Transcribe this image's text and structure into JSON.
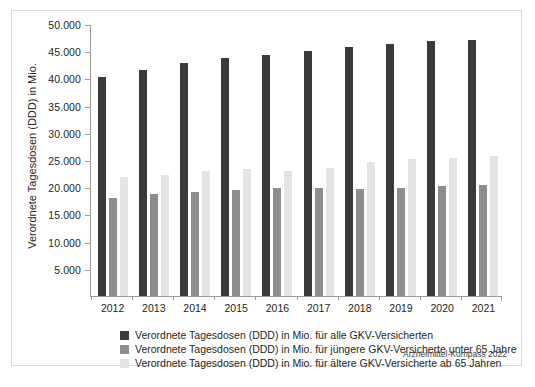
{
  "figure": {
    "source_note": "Arzneimittel-Kompass 2022"
  },
  "chart_data": {
    "type": "bar",
    "title": "",
    "xlabel": "",
    "ylabel": "Verordnete Tagesdosen (DDD) in Mio.",
    "ylim": [
      0,
      50000
    ],
    "ytick_values": [
      50000,
      45000,
      40000,
      35000,
      30000,
      25000,
      20000,
      15000,
      10000,
      5000
    ],
    "ytick_labels": [
      "50.000",
      "45.000",
      "40.000",
      "35.000",
      "30.000",
      "25.000",
      "20.000",
      "15.000",
      "10.000",
      "5.000"
    ],
    "grid": false,
    "legend_position": "below-axis-left",
    "categories": [
      "2012",
      "2013",
      "2014",
      "2015",
      "2016",
      "2017",
      "2018",
      "2019",
      "2020",
      "2021"
    ],
    "series": [
      {
        "name": "Verordnete Tagesdosen (DDD) in Mio. für alle GKV-Versicherten",
        "color": "#3a3a3c",
        "values": [
          40200,
          41600,
          42800,
          43700,
          44300,
          45000,
          45700,
          46300,
          46800,
          47000
        ]
      },
      {
        "name": "Verordnete Tagesdosen (DDD) in Mio. für jüngere GKV-Versicherte unter 65 Jahre",
        "color": "#8d8d8f",
        "values": [
          18000,
          18800,
          19200,
          19500,
          19800,
          19900,
          19700,
          19900,
          20300,
          20400
        ]
      },
      {
        "name": "Verordnete Tagesdosen (DDD) in Mio. für ältere GKV-Versicherte ab 65 Jahren",
        "color": "#e4e4e4",
        "values": [
          21800,
          22300,
          23000,
          23400,
          23000,
          23600,
          24600,
          25200,
          25300,
          25800
        ]
      }
    ]
  }
}
